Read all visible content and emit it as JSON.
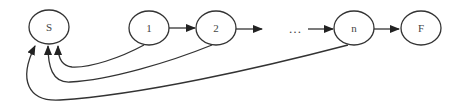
{
  "diagram": {
    "type": "state-transition",
    "colors": {
      "stroke": "#333333",
      "text": "#444444",
      "background": "#ffffff"
    },
    "nodes": [
      {
        "id": "S",
        "label": "S"
      },
      {
        "id": "1",
        "label": "1"
      },
      {
        "id": "2",
        "label": "2"
      },
      {
        "id": "n",
        "label": "n"
      },
      {
        "id": "F",
        "label": "F"
      }
    ],
    "ellipsis": "…",
    "edges": [
      {
        "from": "1",
        "to": "2"
      },
      {
        "from": "2",
        "to": "…"
      },
      {
        "from": "…",
        "to": "n"
      },
      {
        "from": "n",
        "to": "F"
      },
      {
        "from": "1",
        "to": "S"
      },
      {
        "from": "2",
        "to": "S"
      },
      {
        "from": "n",
        "to": "S"
      }
    ]
  }
}
